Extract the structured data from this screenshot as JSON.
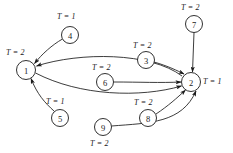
{
  "diagram": {
    "type": "directed-graph",
    "title": "",
    "background_color": "#ffffff",
    "stroke_color": "#1a1a1a",
    "nodes": [
      {
        "id": "1",
        "label": "1",
        "cx": 26,
        "cy": 70,
        "r": 9.5
      },
      {
        "id": "2",
        "label": "2",
        "cx": 191,
        "cy": 82,
        "r": 9.5
      },
      {
        "id": "3",
        "label": "3",
        "cx": 146,
        "cy": 60,
        "r": 8.5
      },
      {
        "id": "4",
        "label": "4",
        "cx": 70,
        "cy": 35,
        "r": 8.5
      },
      {
        "id": "5",
        "label": "5",
        "cx": 60,
        "cy": 118,
        "r": 8.5
      },
      {
        "id": "6",
        "label": "6",
        "cx": 105,
        "cy": 82,
        "r": 8.5
      },
      {
        "id": "7",
        "label": "7",
        "cx": 194,
        "cy": 24,
        "r": 8.5
      },
      {
        "id": "8",
        "label": "8",
        "cx": 148,
        "cy": 118,
        "r": 8.5
      },
      {
        "id": "9",
        "label": "9",
        "cx": 103,
        "cy": 127,
        "r": 8.5
      }
    ],
    "annotations": [
      {
        "id": "t-node-1",
        "text": "T = 2",
        "var": "T",
        "eq": "=",
        "value": "2",
        "x": 6,
        "y": 48,
        "for_node": "1"
      },
      {
        "id": "t-node-2",
        "text": "T = 1",
        "var": "T",
        "eq": "=",
        "value": "1",
        "x": 203,
        "y": 77,
        "for_node": "2"
      },
      {
        "id": "t-node-3",
        "text": "T = 2",
        "var": "T",
        "eq": "=",
        "value": "2",
        "x": 133,
        "y": 41,
        "for_node": "3"
      },
      {
        "id": "t-node-4",
        "text": "T = 1",
        "var": "T",
        "eq": "=",
        "value": "1",
        "x": 57,
        "y": 12,
        "for_node": "4"
      },
      {
        "id": "t-node-5",
        "text": "T = 1",
        "var": "T",
        "eq": "=",
        "value": "1",
        "x": 46,
        "y": 97,
        "for_node": "5"
      },
      {
        "id": "t-node-6",
        "text": "T = 2",
        "var": "T",
        "eq": "=",
        "value": "2",
        "x": 92,
        "y": 63,
        "for_node": "6"
      },
      {
        "id": "t-node-7",
        "text": "T = 2",
        "var": "T",
        "eq": "=",
        "value": "2",
        "x": 181,
        "y": 3,
        "for_node": "7"
      },
      {
        "id": "t-node-8",
        "text": "T = 2",
        "var": "T",
        "eq": "=",
        "value": "2",
        "x": 134,
        "y": 98,
        "for_node": "8"
      },
      {
        "id": "t-node-9",
        "text": "T = 2",
        "var": "T",
        "eq": "=",
        "value": "2",
        "x": 90,
        "y": 139,
        "for_node": "9"
      }
    ],
    "edges": [
      {
        "id": "edge-4-1",
        "from": "4",
        "to": "1",
        "d": "M 62.5 39 C 52 45 42 54 34.5 63.5"
      },
      {
        "id": "edge-5-1",
        "from": "5",
        "to": "1",
        "d": "M 54 111 C 45 103 37 94 31 78.5"
      },
      {
        "id": "edge-2-1",
        "from": "2",
        "to": "1",
        "d": "M 182 76 C 150 52 80 52 36.5 66"
      },
      {
        "id": "edge-1-2",
        "from": "1",
        "to": "2",
        "d": "M 35.5 73 C 80 96 140 98 181.5 86"
      },
      {
        "id": "edge-6-2",
        "from": "6",
        "to": "2",
        "d": "M 113.5 82 C 140 82 160 83 181 82"
      },
      {
        "id": "edge-3-2",
        "from": "3",
        "to": "2",
        "d": "M 154 62 C 168 66 178 71 184 74"
      },
      {
        "id": "edge-7-2",
        "from": "7",
        "to": "2",
        "d": "M 194 32.5 L 192.5 72"
      },
      {
        "id": "edge-8-2",
        "from": "8",
        "to": "2",
        "d": "M 156 114 C 168 106 177 98 185.5 90"
      },
      {
        "id": "edge-9-2",
        "from": "9",
        "to": "2",
        "d": "M 111.5 126 C 150 123 182 123 196 91"
      }
    ],
    "arrow_marker": {
      "id": "arrowhead",
      "width": 6,
      "height": 4.2
    }
  }
}
